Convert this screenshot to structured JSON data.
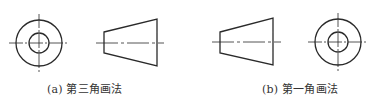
{
  "figure": {
    "colors": {
      "background": "#ffffff",
      "stroke": "#2a2a2a",
      "text": "#333333"
    },
    "panels": [
      {
        "id": "a",
        "caption": "(a) 第三角画法",
        "views": [
          "circular-end-view",
          "trapezoid-side-view"
        ],
        "order": "circle-left, trapezoid-right"
      },
      {
        "id": "b",
        "caption": "(b) 第一角画法",
        "views": [
          "trapezoid-side-view",
          "circular-end-view"
        ],
        "order": "trapezoid-left, circle-right"
      }
    ]
  }
}
